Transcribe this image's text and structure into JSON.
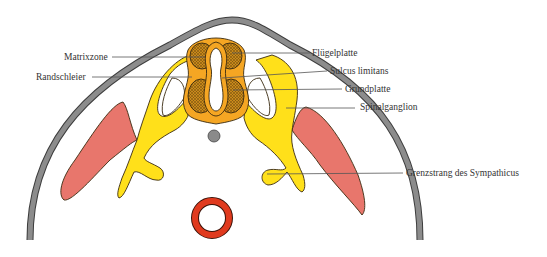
{
  "figure": {
    "labels": {
      "matrixzone": "Matrixzone",
      "randschleier": "Randschleier",
      "fluegelplatte": "Flügelplatte",
      "sulcus_limitans": "Sulcus limitans",
      "grundplatte": "Grundplatte",
      "spinalganglion": "Spinalganglion",
      "grenzstrang": "Grenzstrang des Sympathicus"
    },
    "colors": {
      "body_wall": "#8c8c8c",
      "neural_tube_mantle": "#f5a623",
      "matrix_hatch": "#c98a1c",
      "nerve_yellow": "#ffe01a",
      "muscle_red": "#e8766c",
      "aorta_red": "#e03a1e",
      "notochord_grey": "#8a8a8a",
      "outline": "#3a2a10"
    }
  }
}
